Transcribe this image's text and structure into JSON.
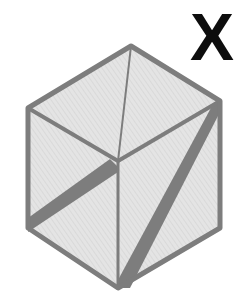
{
  "figure": {
    "label": "X",
    "colors": {
      "background": "#ffffff",
      "face_fill": "#e2e2e2",
      "edge": "#7d7d7d",
      "band": "#7d7d7d",
      "label": "#0d0d0d"
    },
    "cube": {
      "vertices": {
        "top": [
          131,
          46
        ],
        "left_top": [
          28,
          108
        ],
        "right_top": [
          220,
          101
        ],
        "center": [
          118,
          161
        ],
        "left_bottom": [
          28,
          228
        ],
        "right_bottom": [
          220,
          228
        ],
        "bottom": [
          118,
          288
        ]
      },
      "faces": [
        "top",
        "left",
        "right"
      ],
      "thin_lines": [
        {
          "from": "top",
          "to": "center"
        },
        {
          "from": "center",
          "to": "bottom"
        }
      ],
      "thick_bands": [
        {
          "face": "left",
          "from": [
            114,
            166
          ],
          "to": [
            28,
            226
          ]
        },
        {
          "face": "right",
          "from": [
            217,
            104
          ],
          "to": [
            120,
            284
          ]
        }
      ]
    }
  }
}
